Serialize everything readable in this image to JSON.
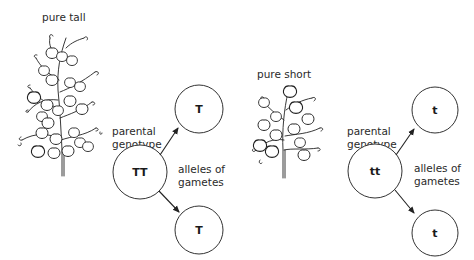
{
  "diagram": {
    "left": {
      "plant_label": "pure tall",
      "parental_label_line1": "parental",
      "parental_label_line2": "genotype",
      "parental_genotype": "TT",
      "gametes_label_line1": "alleles of",
      "gametes_label_line2": "gametes",
      "gamete_top": "T",
      "gamete_bottom": "T"
    },
    "right": {
      "plant_label": "pure short",
      "parental_label_line1": "parental",
      "parental_label_line2": "genotype",
      "parental_genotype": "tt",
      "gametes_label_line1": "alleles of",
      "gametes_label_line2": "gametes",
      "gamete_top": "t",
      "gamete_bottom": "t"
    }
  }
}
